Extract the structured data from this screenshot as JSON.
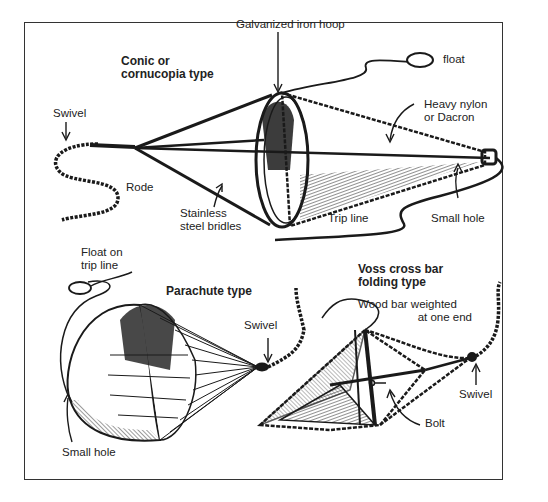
{
  "diagram": {
    "sections": [
      {
        "title": "Conic or cornucopia type",
        "labels": [
          "Galvanized iron hoop",
          "float",
          "Swivel",
          "Heavy nylon or Dacron",
          "Rode",
          "Stainless steel bridles",
          "Trip line",
          "Small hole"
        ]
      },
      {
        "title": "Parachute type",
        "labels": [
          "Float on trip line",
          "Swivel",
          "Small hole"
        ]
      },
      {
        "title": "Voss cross bar folding type",
        "labels": [
          "Wood bar weighted at one end",
          "Swivel",
          "Bolt"
        ]
      }
    ]
  },
  "labels": {
    "conic_title_1": "Conic or",
    "conic_title_2": "cornucopia type",
    "hoop": "Galvanized iron hoop",
    "float": "float",
    "swivel_top": "Swivel",
    "nylon_1": "Heavy nylon",
    "nylon_2": "or Dacron",
    "rode": "Rode",
    "bridles_1": "Stainless",
    "bridles_2": "steel bridles",
    "trip_line": "Trip line",
    "small_hole_top": "Small hole",
    "float_trip_1": "Float on",
    "float_trip_2": "trip line",
    "parachute_title": "Parachute type",
    "swivel_para": "Swivel",
    "voss_title_1": "Voss cross bar",
    "voss_title_2": "folding type",
    "wood_bar_1": "Wood bar weighted",
    "wood_bar_2": "at one end",
    "swivel_voss": "Swivel",
    "bolt": "Bolt",
    "small_hole_para": "Small hole"
  },
  "colors": {
    "ink": "#1a1a1a",
    "paper": "#ffffff",
    "frame": "#333333"
  }
}
